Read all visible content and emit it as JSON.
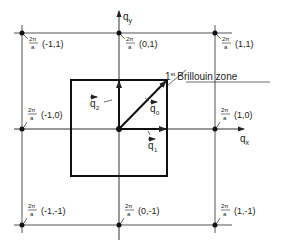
{
  "diagram": {
    "zone_label_sup": "st",
    "zone_label_main": "Brillouin zone",
    "zone_label_num": "1",
    "axes": {
      "x": "q",
      "x_sub": "x",
      "y": "q",
      "y_sub": "y"
    },
    "vectors": [
      {
        "name": "q0",
        "label": "q",
        "sub": "0"
      },
      {
        "name": "q1",
        "label": "q",
        "sub": "1"
      },
      {
        "name": "q2",
        "label": "q",
        "sub": "2"
      }
    ],
    "prefactor_num": "2π",
    "prefactor_den": "a",
    "points": [
      {
        "coords": "(-1,1)"
      },
      {
        "coords": "(0,1)"
      },
      {
        "coords": "(1,1)"
      },
      {
        "coords": "(-1,0)"
      },
      {
        "coords": "(1,0)"
      },
      {
        "coords": "(-1,-1)"
      },
      {
        "coords": "(0,-1)"
      },
      {
        "coords": "(1,-1)"
      }
    ],
    "colors": {
      "line": "#222222",
      "grid": "#555555",
      "background": "#ffffff"
    }
  }
}
